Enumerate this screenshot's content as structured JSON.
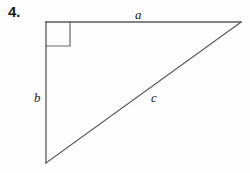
{
  "figure": {
    "item_number": "4.",
    "type": "right-triangle",
    "labels": {
      "horizontal_leg": "a",
      "vertical_leg": "b",
      "hypotenuse": "c"
    },
    "right_angle_marker": "square",
    "colors": {
      "background": "#fdfdfd",
      "stroke": "#4a4a4a",
      "text": "#1a1a1a"
    },
    "vertices": {
      "right_angle": [
        46,
        22
      ],
      "top_right": [
        241,
        22
      ],
      "bottom_left": [
        46,
        163
      ]
    },
    "right_angle_square": {
      "x": 46,
      "y": 22,
      "size": 24
    }
  }
}
